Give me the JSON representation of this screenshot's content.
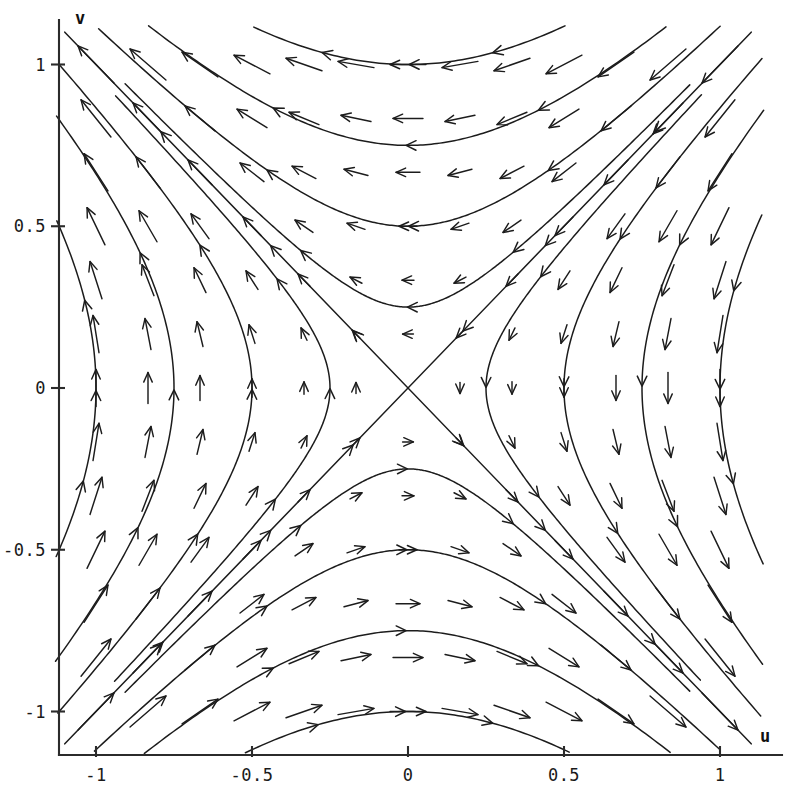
{
  "figure": {
    "title": "",
    "background_color": "#ffffff",
    "ink_color": "#1c1c1c"
  },
  "axes": {
    "x_axis_label": "u",
    "y_axis_label": "v",
    "x_ticks": [
      "-1",
      "-0.5",
      "0",
      "0.5",
      "1"
    ],
    "x_tick_values": [
      -1,
      -0.5,
      0,
      0.5,
      1
    ],
    "y_ticks": [
      "1",
      "0.5",
      "0",
      "-0.5",
      "-1"
    ],
    "y_tick_values": [
      1,
      0.5,
      0,
      -0.5,
      -1
    ],
    "x_range": [
      -1.15,
      1.17
    ],
    "y_range": [
      -1.15,
      1.14
    ],
    "grid": false
  },
  "chart_data": {
    "type": "line",
    "title": "",
    "xlabel": "u",
    "ylabel": "v",
    "xlim": [
      -1.15,
      1.17
    ],
    "ylim": [
      -1.15,
      1.14
    ],
    "grid": false,
    "legend": null,
    "system": {
      "udot": "-v",
      "vdot": "-u",
      "fixed_point": [
        0,
        0
      ],
      "fixed_point_type": "saddle"
    },
    "separatrices": [
      {
        "name": "stable-separatrix",
        "equation": "v = -u",
        "p1": [
          -1.1,
          1.1
        ],
        "p2": [
          1.1,
          -1.1
        ],
        "flow": "toward-origin"
      },
      {
        "name": "unstable-separatrix",
        "equation": "v = u",
        "p1": [
          -1.1,
          -1.1
        ],
        "p2": [
          1.1,
          1.1
        ],
        "flow": "away-from-origin"
      }
    ],
    "trajectory_constants": [
      0.0625,
      0.25,
      0.5625,
      1.0,
      1.5625
    ],
    "trajectories": [
      {
        "branch": "top",
        "vertex_v": 0.25,
        "direction": "left"
      },
      {
        "branch": "top",
        "vertex_v": 0.5,
        "direction": "left"
      },
      {
        "branch": "top",
        "vertex_v": 0.75,
        "direction": "left"
      },
      {
        "branch": "bottom",
        "vertex_v": -0.25,
        "direction": "right"
      },
      {
        "branch": "bottom",
        "vertex_v": -0.5,
        "direction": "right"
      },
      {
        "branch": "bottom",
        "vertex_v": -0.75,
        "direction": "right"
      },
      {
        "branch": "left",
        "vertex_u": -0.25,
        "direction": "up"
      },
      {
        "branch": "left",
        "vertex_u": -0.5,
        "direction": "up"
      },
      {
        "branch": "left",
        "vertex_u": -0.75,
        "direction": "up"
      },
      {
        "branch": "right",
        "vertex_u": 0.25,
        "direction": "down"
      },
      {
        "branch": "right",
        "vertex_u": 0.5,
        "direction": "down"
      },
      {
        "branch": "right",
        "vertex_u": 0.75,
        "direction": "down"
      }
    ],
    "vector_field": {
      "grid_u_min": -1.0,
      "grid_u_max": 1.0,
      "grid_v_min": -1.0,
      "grid_v_max": 1.0,
      "grid_steps": 13,
      "arrow_scale": 0.115
    }
  }
}
